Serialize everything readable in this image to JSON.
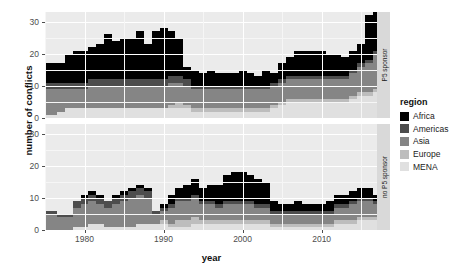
{
  "chart_data": {
    "type": "area",
    "title": "",
    "xlabel": "year",
    "ylabel": "number of conflicts",
    "xlim": [
      1975,
      2017
    ],
    "ylim": [
      0,
      33
    ],
    "yticks": [
      0,
      10,
      20,
      30
    ],
    "xticks": [
      1980,
      1990,
      2000,
      2010
    ],
    "grid": true,
    "legend_position": "right",
    "legend_title": "region",
    "stacked": true,
    "stack_order": [
      "MENA",
      "Europe",
      "Asia",
      "Americas",
      "Africa"
    ],
    "facets": [
      {
        "label": "P5 sponsor",
        "position": "top"
      },
      {
        "label": "no P5 sponsor",
        "position": "bottom"
      }
    ],
    "series_colors": {
      "Africa": "#000000",
      "Americas": "#4d4d4d",
      "Asia": "#858585",
      "Europe": "#bdbdbd",
      "MENA": "#e0e0e0"
    },
    "x": [
      1975,
      1976,
      1977,
      1978,
      1979,
      1980,
      1981,
      1982,
      1983,
      1984,
      1985,
      1986,
      1987,
      1988,
      1989,
      1990,
      1991,
      1992,
      1993,
      1994,
      1995,
      1996,
      1997,
      1998,
      1999,
      2000,
      2001,
      2002,
      2003,
      2004,
      2005,
      2006,
      2007,
      2008,
      2009,
      2010,
      2011,
      2012,
      2013,
      2014,
      2015,
      2016,
      2017
    ],
    "panels": [
      {
        "facet": "P5 sponsor",
        "series": [
          {
            "name": "MENA",
            "values": [
              1,
              1,
              2,
              3,
              3,
              3,
              3,
              3,
              3,
              3,
              3,
              3,
              3,
              3,
              3,
              3,
              3,
              3,
              3,
              2,
              2,
              2,
              2,
              2,
              2,
              2,
              2,
              2,
              2,
              3,
              4,
              5,
              5,
              5,
              5,
              5,
              5,
              5,
              5,
              6,
              7,
              7,
              8
            ]
          },
          {
            "name": "Europe",
            "values": [
              0,
              0,
              0,
              0,
              0,
              0,
              0,
              0,
              0,
              0,
              0,
              0,
              0,
              0,
              0,
              0,
              1,
              2,
              1,
              1,
              1,
              1,
              1,
              1,
              1,
              1,
              1,
              1,
              1,
              1,
              1,
              1,
              1,
              1,
              1,
              1,
              1,
              1,
              1,
              1,
              1,
              1,
              1
            ]
          },
          {
            "name": "Asia",
            "values": [
              8,
              8,
              7,
              6,
              6,
              6,
              7,
              7,
              7,
              7,
              7,
              7,
              7,
              7,
              7,
              7,
              7,
              6,
              6,
              6,
              6,
              6,
              6,
              6,
              6,
              6,
              6,
              6,
              6,
              6,
              6,
              6,
              6,
              6,
              6,
              6,
              6,
              6,
              6,
              7,
              8,
              9,
              11
            ]
          },
          {
            "name": "Americas",
            "values": [
              2,
              2,
              2,
              2,
              2,
              2,
              2,
              2,
              2,
              2,
              2,
              2,
              2,
              2,
              2,
              2,
              2,
              2,
              2,
              1,
              1,
              1,
              1,
              1,
              1,
              1,
              1,
              1,
              1,
              1,
              1,
              1,
              1,
              1,
              1,
              1,
              1,
              1,
              1,
              1,
              1,
              1,
              1
            ]
          },
          {
            "name": "Africa",
            "values": [
              6,
              6,
              6,
              9,
              10,
              10,
              10,
              11,
              14,
              12,
              13,
              13,
              15,
              11,
              15,
              16,
              14,
              12,
              4,
              5,
              4,
              5,
              4,
              4,
              4,
              5,
              4,
              3,
              5,
              3,
              5,
              6,
              8,
              8,
              8,
              8,
              7,
              7,
              6,
              6,
              6,
              14,
              12
            ]
          }
        ]
      },
      {
        "facet": "no P5 sponsor",
        "series": [
          {
            "name": "MENA",
            "values": [
              0,
              0,
              0,
              0,
              1,
              1,
              2,
              2,
              1,
              1,
              1,
              1,
              2,
              2,
              2,
              2,
              1,
              1,
              1,
              2,
              2,
              2,
              2,
              2,
              2,
              2,
              2,
              2,
              2,
              1,
              1,
              1,
              1,
              1,
              1,
              1,
              1,
              2,
              2,
              2,
              3,
              3,
              3
            ]
          },
          {
            "name": "Europe",
            "values": [
              0,
              0,
              0,
              0,
              0,
              0,
              0,
              0,
              0,
              0,
              0,
              0,
              0,
              0,
              0,
              1,
              1,
              2,
              2,
              2,
              1,
              1,
              1,
              1,
              1,
              1,
              1,
              1,
              1,
              1,
              1,
              1,
              1,
              1,
              1,
              1,
              1,
              1,
              1,
              1,
              1,
              1,
              1
            ]
          },
          {
            "name": "Asia",
            "values": [
              5,
              5,
              4,
              4,
              6,
              7,
              7,
              6,
              6,
              7,
              8,
              9,
              9,
              8,
              3,
              3,
              5,
              6,
              6,
              6,
              5,
              5,
              4,
              5,
              5,
              5,
              5,
              4,
              4,
              3,
              3,
              3,
              3,
              3,
              3,
              3,
              3,
              4,
              4,
              5,
              5,
              5,
              4
            ]
          },
          {
            "name": "Americas",
            "values": [
              1,
              1,
              1,
              1,
              2,
              2,
              2,
              2,
              2,
              2,
              2,
              2,
              2,
              2,
              1,
              1,
              1,
              1,
              1,
              1,
              1,
              1,
              1,
              1,
              1,
              1,
              1,
              1,
              1,
              1,
              1,
              1,
              1,
              1,
              1,
              1,
              1,
              1,
              1,
              1,
              1,
              1,
              1
            ]
          },
          {
            "name": "Africa",
            "values": [
              0,
              0,
              0,
              0,
              0,
              1,
              1,
              1,
              0,
              1,
              1,
              1,
              1,
              1,
              0,
              1,
              3,
              3,
              4,
              5,
              4,
              5,
              6,
              8,
              9,
              9,
              8,
              8,
              7,
              3,
              2,
              2,
              3,
              2,
              2,
              2,
              3,
              3,
              3,
              3,
              3,
              3,
              2
            ]
          }
        ]
      }
    ]
  },
  "axes": {
    "ylabel": "number of conflicts",
    "xlabel": "year",
    "ytick_labels": [
      "30",
      "20",
      "10",
      "0"
    ],
    "xtick_labels": [
      "1980",
      "1990",
      "2000",
      "2010"
    ]
  },
  "strips": {
    "top": "P5 sponsor",
    "bottom": "no P5 sponsor"
  },
  "legend": {
    "title": "region",
    "items": [
      {
        "label": "Africa",
        "color": "#000000"
      },
      {
        "label": "Americas",
        "color": "#4d4d4d"
      },
      {
        "label": "Asia",
        "color": "#858585"
      },
      {
        "label": "Europe",
        "color": "#bdbdbd"
      },
      {
        "label": "MENA",
        "color": "#e0e0e0"
      }
    ]
  }
}
